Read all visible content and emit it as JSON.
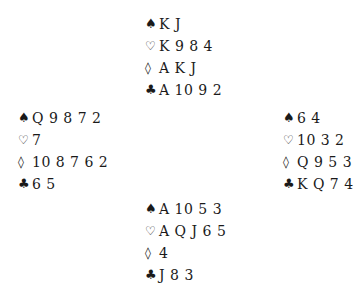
{
  "suits": {
    "spades": "♠",
    "hearts": "♡",
    "diamonds": "◊",
    "clubs": "♣"
  },
  "hands": {
    "north": {
      "spades": "K J",
      "hearts": "K 9 8 4",
      "diamonds": "A K J",
      "clubs": "A 10 9 2"
    },
    "west": {
      "spades": "Q 9 8 7 2",
      "hearts": "7",
      "diamonds": "10 8 7 6 2",
      "clubs": "6 5"
    },
    "east": {
      "spades": "6 4",
      "hearts": "10 3 2",
      "diamonds": "Q 9 5 3",
      "clubs": "K Q 7 4"
    },
    "south": {
      "spades": "A 10 5 3",
      "hearts": "A Q J 6 5",
      "diamonds": "4",
      "clubs": "J 8 3"
    }
  }
}
